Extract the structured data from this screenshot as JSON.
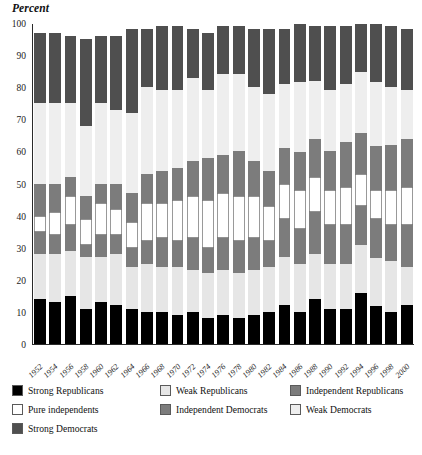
{
  "chart_data": {
    "type": "bar",
    "stacked": true,
    "title": "Percent",
    "xlabel": "",
    "ylabel": "Percent",
    "ylim": [
      0,
      100
    ],
    "yticks": [
      0,
      10,
      20,
      30,
      40,
      50,
      60,
      70,
      80,
      90,
      100
    ],
    "grid": false,
    "legend_position": "bottom",
    "categories": [
      "1952",
      "1954",
      "1956",
      "1958",
      "1960",
      "1962",
      "1964",
      "1966",
      "1968",
      "1970",
      "1972",
      "1974",
      "1976",
      "1978",
      "1980",
      "1982",
      "1984",
      "1986",
      "1988",
      "1990",
      "1992",
      "1994",
      "1996",
      "1998",
      "2000"
    ],
    "series": [
      {
        "name": "Strong Republicans",
        "color": "#000000",
        "values": [
          14,
          13,
          15,
          11,
          13,
          12,
          11,
          10,
          10,
          9,
          10,
          8,
          9,
          8,
          9,
          10,
          12,
          10,
          14,
          11,
          11,
          16,
          12,
          10,
          12
        ]
      },
      {
        "name": "Weak Republicans",
        "color": "#e6e6e6",
        "values": [
          14,
          15,
          14,
          16,
          14,
          16,
          13,
          15,
          14,
          15,
          13,
          14,
          14,
          14,
          14,
          14,
          15,
          15,
          14,
          14,
          14,
          15,
          15,
          16,
          12
        ]
      },
      {
        "name": "Independent Republicans",
        "color": "#7c7c7c",
        "values": [
          7,
          6,
          8,
          4,
          7,
          6,
          6,
          7,
          9,
          8,
          10,
          8,
          10,
          10,
          10,
          8,
          12,
          11,
          13,
          12,
          12,
          12,
          12,
          11,
          13
        ]
      },
      {
        "name": "Pure independents",
        "color": "#ffffff",
        "values": [
          5,
          7,
          9,
          8,
          10,
          8,
          8,
          12,
          11,
          13,
          13,
          15,
          14,
          14,
          13,
          11,
          11,
          12,
          11,
          11,
          12,
          10,
          9,
          11,
          12
        ]
      },
      {
        "name": "Independent Democrats",
        "color": "#7c7c7c",
        "values": [
          10,
          9,
          6,
          7,
          6,
          8,
          9,
          9,
          10,
          10,
          11,
          13,
          12,
          14,
          11,
          11,
          11,
          12,
          12,
          12,
          14,
          13,
          14,
          14,
          15
        ]
      },
      {
        "name": "Weak Democrats",
        "color": "#eeeeee",
        "values": [
          25,
          25,
          23,
          22,
          25,
          23,
          25,
          27,
          25,
          24,
          26,
          21,
          25,
          24,
          23,
          24,
          20,
          22,
          18,
          19,
          18,
          19,
          20,
          18,
          15
        ]
      },
      {
        "name": "Strong Democrats",
        "color": "#4f4f4f",
        "values": [
          22,
          22,
          21,
          27,
          21,
          23,
          26,
          18,
          20,
          20,
          15,
          18,
          15,
          15,
          18,
          20,
          17,
          18,
          17,
          20,
          18,
          15,
          18,
          19,
          19
        ]
      }
    ],
    "legend_entries": [
      {
        "label": "Strong Republicans",
        "color": "#000000"
      },
      {
        "label": "Weak Republicans",
        "color": "#e6e6e6"
      },
      {
        "label": "Independent Republicans",
        "color": "#7c7c7c"
      },
      {
        "label": "Pure independents",
        "color": "#ffffff"
      },
      {
        "label": "Independent Democrats",
        "color": "#7c7c7c"
      },
      {
        "label": "Weak Democrats",
        "color": "#eeeeee"
      },
      {
        "label": "Strong Democrats",
        "color": "#4f4f4f"
      }
    ]
  }
}
